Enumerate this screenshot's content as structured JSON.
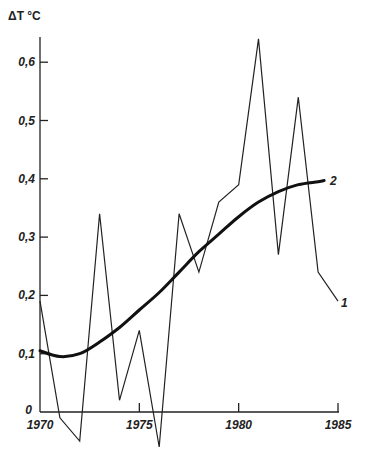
{
  "chart_data": {
    "type": "line",
    "title": "",
    "ylabel": "ΔT °C",
    "xlabel": "",
    "xlim": [
      1970,
      1985
    ],
    "ylim": [
      0,
      0.65
    ],
    "grid": false,
    "x_ticks": [
      "1970",
      "1975",
      "1980",
      "1985"
    ],
    "y_ticks": [
      "0",
      "0,1",
      "0,2",
      "0,3",
      "0,4",
      "0,5",
      "0,6"
    ],
    "series": [
      {
        "name": "1",
        "style": "thin",
        "x": [
          1970,
          1971,
          1972,
          1973,
          1974,
          1975,
          1976,
          1977,
          1978,
          1979,
          1980,
          1981,
          1982,
          1983,
          1984,
          1985
        ],
        "values": [
          0.19,
          -0.01,
          -0.05,
          0.34,
          0.02,
          0.14,
          -0.06,
          0.34,
          0.24,
          0.36,
          0.39,
          0.64,
          0.27,
          0.54,
          0.24,
          0.19
        ]
      },
      {
        "name": "2",
        "style": "thick-smoothed",
        "x": [
          1970,
          1971,
          1972,
          1973,
          1974,
          1975,
          1976,
          1977,
          1978,
          1979,
          1980,
          1981,
          1982,
          1983,
          1984,
          1984.3
        ],
        "values": [
          0.105,
          0.095,
          0.1,
          0.12,
          0.145,
          0.175,
          0.205,
          0.24,
          0.275,
          0.305,
          0.335,
          0.36,
          0.378,
          0.39,
          0.395,
          0.397
        ]
      }
    ],
    "annotations": [
      {
        "text": "1",
        "target": "series 1 end"
      },
      {
        "text": "2",
        "target": "series 2 end"
      }
    ]
  }
}
